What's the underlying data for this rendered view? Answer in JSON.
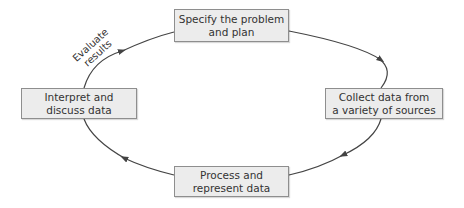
{
  "diagram": {
    "type": "cycle",
    "nodes": [
      {
        "id": "top",
        "line1": "Specify the problem",
        "line2": "and plan"
      },
      {
        "id": "right",
        "line1": "Collect data from",
        "line2": "a variety of sources"
      },
      {
        "id": "bottom",
        "line1": "Process and",
        "line2": "represent data"
      },
      {
        "id": "left",
        "line1": "Interpret and",
        "line2": "discuss data"
      }
    ],
    "edge_label": {
      "line1": "Evaluate",
      "line2": "results"
    },
    "colors": {
      "box_fill": "#ececec",
      "box_border": "#8e8e8e",
      "line": "#444444"
    }
  }
}
